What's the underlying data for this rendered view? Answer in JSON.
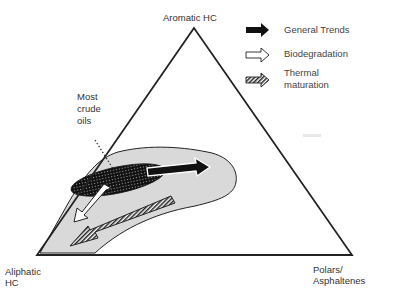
{
  "diagram": {
    "type": "ternary",
    "vertices": {
      "top": "Aromatic HC",
      "bottom_left": [
        "Aliphatic",
        "HC"
      ],
      "bottom_right": [
        "Polars/",
        "Asphaltenes"
      ]
    },
    "annotation": [
      "Most",
      "crude",
      "oils"
    ],
    "legend": [
      {
        "label": "General Trends",
        "style": "solid-black-arrow"
      },
      {
        "label": "Biodegradation",
        "style": "white-outline-arrow"
      },
      {
        "label_lines": [
          "Thermal",
          "maturation"
        ],
        "style": "hatched-arrow"
      }
    ],
    "colors": {
      "outline": "#222222",
      "field_fill": "#d9d9d9",
      "crude_oil_fill": "#1a1a1a"
    }
  }
}
